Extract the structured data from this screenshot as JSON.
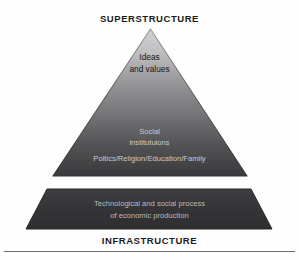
{
  "figure": {
    "type": "pyramid-diagram",
    "top_heading": "SUPERSTRUCTURE",
    "bottom_heading": "INFRASTRUCTURE"
  },
  "pyramid": {
    "tiers": [
      {
        "id": "ideas",
        "line1": "Ideas",
        "line2": "and values",
        "fill_start": "#c4c4c6",
        "text_color": "#17171a"
      },
      {
        "id": "social-institutions",
        "line1": "Social",
        "line2": "institutuions",
        "detail": "Poltics/Religion/Education/Family",
        "fill_end": "#3b3b3e",
        "text_color": "#c9c9cc"
      }
    ]
  },
  "base_block": {
    "id": "infrastructure-block",
    "line1": "Technological and social process",
    "line2": "of economic production",
    "fill": "#37373a",
    "text_color": "#b9b9bd"
  },
  "colors": {
    "background": "#fefefe",
    "heading_text": "#1c1c1c",
    "gradient_top": "#cbcbcd",
    "gradient_bottom": "#3a3a3d",
    "outline": "#2b2b2e",
    "rule": "#6e6e72"
  }
}
